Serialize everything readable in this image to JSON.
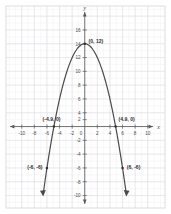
{
  "chart_data": {
    "type": "line",
    "title": "",
    "xlabel": "x",
    "ylabel": "y",
    "grid": true,
    "legend": null,
    "xlim": [
      -11,
      11
    ],
    "ylim": [
      -11,
      17
    ],
    "x_ticks": [
      -10,
      -8,
      -6,
      -4,
      -2,
      0,
      2,
      4,
      6,
      8,
      10
    ],
    "x_tick_labels": [
      "-10",
      "-8",
      "-6",
      "-4",
      "-2",
      "0",
      "2",
      "4",
      "6",
      "8",
      "10"
    ],
    "y_ticks": [
      -10,
      -8,
      -6,
      -4,
      -2,
      2,
      4,
      6,
      8,
      10,
      12,
      14,
      16
    ],
    "y_tick_labels": [
      "-10",
      "-8",
      "-6",
      "-4",
      "-2",
      "2",
      "4",
      "6",
      "8",
      "10",
      "12",
      "14",
      "16"
    ],
    "curve": {
      "name": "parabola",
      "equation": "y = -0.5x^2 + 12",
      "vertex": [
        0,
        12
      ],
      "opens": "down",
      "color": "#4a4a4a",
      "x_domain": [
        -6.6,
        6.6
      ],
      "x": [
        -6.6,
        -6.3,
        -6.0,
        -5.7,
        -5.4,
        -5.1,
        -4.9,
        -4.5,
        -4.2,
        -3.9,
        -3.6,
        -3.3,
        -3.0,
        -2.7,
        -2.4,
        -2.1,
        -1.8,
        -1.5,
        -1.2,
        -0.9,
        -0.6,
        -0.3,
        0.0,
        0.3,
        0.6,
        0.9,
        1.2,
        1.5,
        1.8,
        2.1,
        2.4,
        2.7,
        3.0,
        3.3,
        3.6,
        3.9,
        4.2,
        4.5,
        4.9,
        5.1,
        5.4,
        5.7,
        6.0,
        6.3,
        6.6
      ],
      "y": [
        -9.78,
        -7.85,
        -6.0,
        -4.25,
        -2.58,
        -1.0,
        0.0,
        1.88,
        3.18,
        4.4,
        5.52,
        6.56,
        7.5,
        8.36,
        9.12,
        9.8,
        10.38,
        10.88,
        11.28,
        11.6,
        11.82,
        11.96,
        12.0,
        11.96,
        11.82,
        11.6,
        11.28,
        10.88,
        10.38,
        9.8,
        9.12,
        8.36,
        7.5,
        6.56,
        5.52,
        4.4,
        3.18,
        1.88,
        0.0,
        -1.0,
        -2.58,
        -4.25,
        -6.0,
        -7.85,
        -9.78
      ]
    },
    "annotations": [
      {
        "id": "vertex",
        "label": "(0, 12)",
        "point": [
          0,
          12
        ]
      },
      {
        "id": "x-intercept-left",
        "label": "(-4.9, 0)",
        "point": [
          -4.9,
          0
        ]
      },
      {
        "id": "x-intercept-right",
        "label": "(4.9, 0)",
        "point": [
          4.9,
          0
        ]
      },
      {
        "id": "point-lower-left",
        "label": "(-6, -6)",
        "point": [
          -6,
          -6
        ]
      },
      {
        "id": "point-lower-right",
        "label": "(6, -6)",
        "point": [
          6,
          -6
        ]
      }
    ],
    "colors": {
      "background": "#ffffff",
      "minor_grid": "#ededf0",
      "major_grid": "#dcdce2",
      "axis": "#5a5a5a",
      "curve": "#4a4a4a",
      "border": "#d2d2d8"
    }
  },
  "labels": {
    "x_axis": "x",
    "y_axis": "y",
    "vertex": "(0, 12)",
    "x_intercept_left": "(-4.9, 0)",
    "x_intercept_right": "(4.9, 0)",
    "point_lower_left": "(-6, -6)",
    "point_lower_right": "(6, -6)",
    "xt_neg10": "-10",
    "xt_neg8": "-8",
    "xt_neg6": "-6",
    "xt_neg4": "-4",
    "xt_neg2": "-2",
    "xt_0": "0",
    "xt_2": "2",
    "xt_4": "4",
    "xt_6": "6",
    "xt_8": "8",
    "xt_10": "10",
    "yt_16": "16",
    "yt_14": "14",
    "yt_12": "12",
    "yt_10": "10",
    "yt_8": "8",
    "yt_6": "6",
    "yt_4": "4",
    "yt_2": "2",
    "yt_neg2": "-2",
    "yt_neg4": "-4",
    "yt_neg6": "-6",
    "yt_neg8": "-8",
    "yt_neg10": "-10"
  }
}
